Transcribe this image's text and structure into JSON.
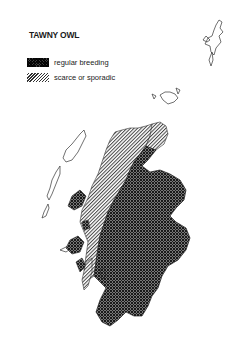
{
  "title": "TAWNY OWL",
  "legend": {
    "items": [
      {
        "label": "regular breeding",
        "pattern": "cross-hatch-dark",
        "color": "#3a3a3a"
      },
      {
        "label": "scarce or sporadic",
        "pattern": "diagonal-hatch-light",
        "color": "#9a9a9a"
      }
    ]
  },
  "map": {
    "region": "Scotland",
    "areas": [
      {
        "name": "regular-breeding-area",
        "category": "regular breeding"
      },
      {
        "name": "scarce-area",
        "category": "scarce or sporadic"
      }
    ]
  }
}
